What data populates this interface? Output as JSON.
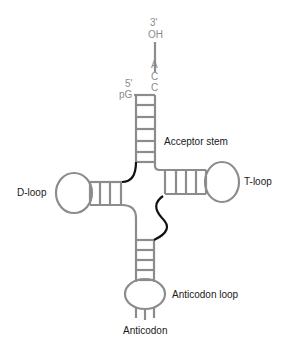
{
  "diagram": {
    "colors": {
      "strand": "#8c8c8c",
      "linker": "#111111",
      "label": "#1a1a1a",
      "nucleotide": "#8a8a8a"
    },
    "three_prime_end": {
      "label": "3'",
      "group": "OH",
      "bases": [
        "A",
        "C",
        "C"
      ]
    },
    "five_prime_end": {
      "label": "5'",
      "group": "pG"
    },
    "labels": {
      "acceptor_stem": "Acceptor stem",
      "d_loop": "D-loop",
      "t_loop": "T-loop",
      "anticodon_loop": "Anticodon loop",
      "anticodon": "Anticodon"
    }
  }
}
